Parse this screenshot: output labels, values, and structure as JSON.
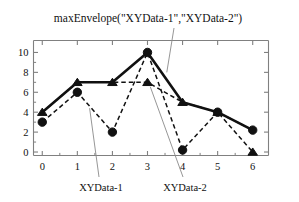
{
  "figure": {
    "annotation": "maxEnvelope(\"XYData-1\",\"XYData-2\")",
    "label_series1": "XYData-1",
    "label_series2": "XYData-2",
    "colors": {
      "ink": "#111111",
      "axis": "#808080",
      "leader": "#8a8a8a",
      "background": "#ffffff"
    }
  },
  "chart_data": {
    "type": "line",
    "title": "maxEnvelope(\"XYData-1\",\"XYData-2\")",
    "xlabel": "",
    "ylabel": "",
    "x": [
      0,
      1,
      2,
      3,
      4,
      5,
      6
    ],
    "xlim": [
      -0.25,
      6.45
    ],
    "ylim": [
      -0.35,
      11.2
    ],
    "xticks": [
      0,
      1,
      2,
      3,
      4,
      5,
      6
    ],
    "xticklabels": [
      "0",
      "1",
      "2",
      "3",
      "4",
      "5",
      "6"
    ],
    "yticks": [
      0,
      2,
      4,
      6,
      8,
      10
    ],
    "yticklabels": [
      "0",
      "2",
      "4",
      "6",
      "8",
      "10"
    ],
    "grid": false,
    "legend": "none",
    "series": [
      {
        "name": "XYData-1",
        "marker": "circle",
        "linestyle": "dashed",
        "values": [
          3,
          6,
          2,
          10,
          0.2,
          4,
          2.2
        ]
      },
      {
        "name": "XYData-2",
        "marker": "triangle",
        "linestyle": "dashed",
        "values": [
          4,
          7,
          7,
          7,
          5,
          4,
          0
        ]
      },
      {
        "name": "maxEnvelope",
        "marker": "none",
        "linestyle": "solid-bold",
        "values": [
          4,
          7,
          7,
          10,
          5,
          4,
          2.2
        ]
      }
    ],
    "annotations": [
      {
        "text": "maxEnvelope(\"XYData-1\",\"XYData-2\")",
        "points_to_x": 3.55,
        "points_to_y": 8.0
      },
      {
        "text": "XYData-1",
        "points_to_x": 1.35,
        "points_to_y": 4.4
      },
      {
        "text": "XYData-2",
        "points_to_x": 3.1,
        "points_to_y": 6.6
      }
    ]
  }
}
